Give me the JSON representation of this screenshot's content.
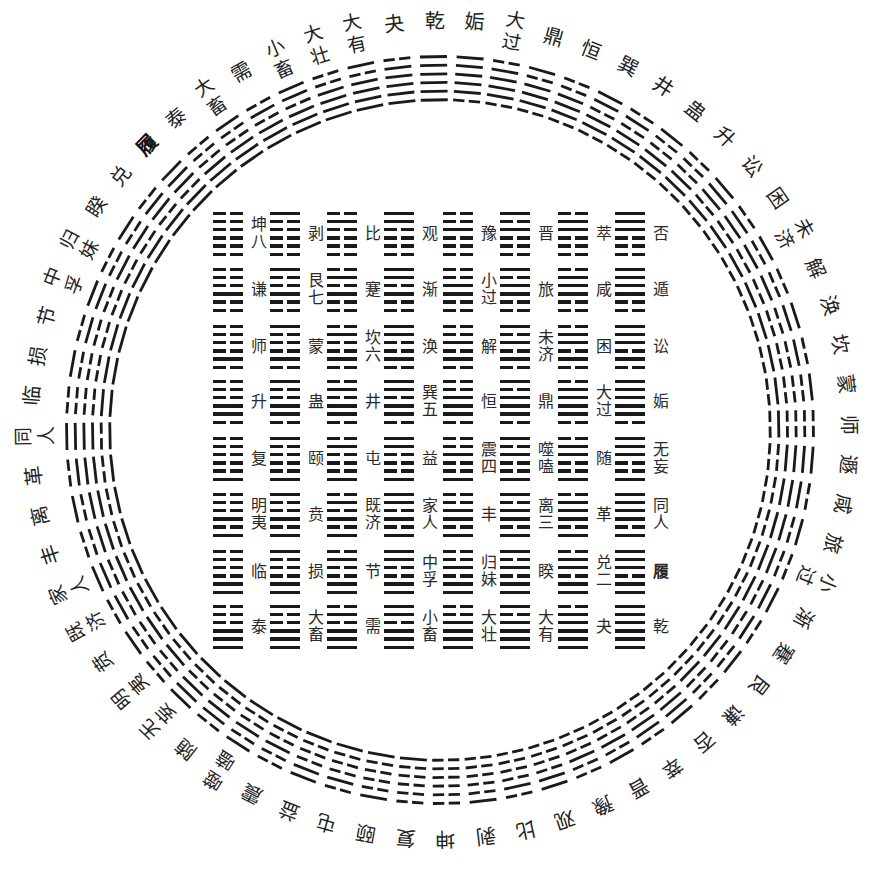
{
  "colors": {
    "background": "#ffffff",
    "ink": "#1a1a1a",
    "text": "#222222"
  },
  "ring": {
    "direction": "clockwise from top",
    "items": [
      {
        "label": "乾",
        "lines": "111111"
      },
      {
        "label": "姤",
        "lines": "111110"
      },
      {
        "label": "大过",
        "lines": "011110"
      },
      {
        "label": "鼎",
        "lines": "101110"
      },
      {
        "label": "恒",
        "lines": "001110"
      },
      {
        "label": "巽",
        "lines": "110110"
      },
      {
        "label": "井",
        "lines": "010110"
      },
      {
        "label": "蛊",
        "lines": "100110"
      },
      {
        "label": "升",
        "lines": "000110"
      },
      {
        "label": "讼",
        "lines": "111010"
      },
      {
        "label": "困",
        "lines": "011010"
      },
      {
        "label": "未济",
        "lines": "101010"
      },
      {
        "label": "解",
        "lines": "001010"
      },
      {
        "label": "涣",
        "lines": "110010"
      },
      {
        "label": "坎",
        "lines": "010010"
      },
      {
        "label": "蒙",
        "lines": "100010"
      },
      {
        "label": "师",
        "lines": "000010"
      },
      {
        "label": "遯",
        "lines": "111100"
      },
      {
        "label": "咸",
        "lines": "011100"
      },
      {
        "label": "旅",
        "lines": "101100"
      },
      {
        "label": "小过",
        "lines": "001100"
      },
      {
        "label": "渐",
        "lines": "110100"
      },
      {
        "label": "蹇",
        "lines": "010100"
      },
      {
        "label": "艮",
        "lines": "100100"
      },
      {
        "label": "谦",
        "lines": "000100"
      },
      {
        "label": "否",
        "lines": "111000"
      },
      {
        "label": "萃",
        "lines": "011000"
      },
      {
        "label": "晋",
        "lines": "101000"
      },
      {
        "label": "豫",
        "lines": "001000"
      },
      {
        "label": "观",
        "lines": "110000"
      },
      {
        "label": "比",
        "lines": "010000"
      },
      {
        "label": "剥",
        "lines": "100000"
      },
      {
        "label": "坤",
        "lines": "000000"
      },
      {
        "label": "复",
        "lines": "000001"
      },
      {
        "label": "颐",
        "lines": "100001"
      },
      {
        "label": "屯",
        "lines": "010001"
      },
      {
        "label": "益",
        "lines": "110001"
      },
      {
        "label": "震",
        "lines": "001001"
      },
      {
        "label": "噬嗑",
        "lines": "101001"
      },
      {
        "label": "随",
        "lines": "011001"
      },
      {
        "label": "无妄",
        "lines": "111001"
      },
      {
        "label": "明夷",
        "lines": "000101"
      },
      {
        "label": "贲",
        "lines": "100101"
      },
      {
        "label": "既济",
        "lines": "010101"
      },
      {
        "label": "家人",
        "lines": "110101"
      },
      {
        "label": "丰",
        "lines": "001101"
      },
      {
        "label": "离",
        "lines": "101101"
      },
      {
        "label": "革",
        "lines": "011101"
      },
      {
        "label": "同人",
        "lines": "111101"
      },
      {
        "label": "临",
        "lines": "000011"
      },
      {
        "label": "损",
        "lines": "100011"
      },
      {
        "label": "节",
        "lines": "010011"
      },
      {
        "label": "中孚",
        "lines": "110011"
      },
      {
        "label": "归妹",
        "lines": "001011"
      },
      {
        "label": "睽",
        "lines": "101011"
      },
      {
        "label": "兑",
        "lines": "011011"
      },
      {
        "label": "履",
        "lines": "111011",
        "bold": true
      },
      {
        "label": "泰",
        "lines": "000111"
      },
      {
        "label": "大畜",
        "lines": "100111"
      },
      {
        "label": "需",
        "lines": "010111"
      },
      {
        "label": "小畜",
        "lines": "110111"
      },
      {
        "label": "大壮",
        "lines": "001111"
      },
      {
        "label": "大有",
        "lines": "101111"
      },
      {
        "label": "夬",
        "lines": "011111"
      }
    ]
  },
  "grid": {
    "rows": [
      {
        "cells": [
          {
            "label": "坤八",
            "lines": "000000"
          },
          {
            "label": "剥",
            "lines": "100000"
          },
          {
            "label": "比",
            "lines": "010000"
          },
          {
            "label": "观",
            "lines": "110000"
          },
          {
            "label": "豫",
            "lines": "001000"
          },
          {
            "label": "晋",
            "lines": "101000"
          },
          {
            "label": "萃",
            "lines": "011000"
          },
          {
            "label": "否",
            "lines": "111000"
          }
        ]
      },
      {
        "cells": [
          {
            "label": "谦",
            "lines": "000100"
          },
          {
            "label": "艮七",
            "lines": "100100"
          },
          {
            "label": "蹇",
            "lines": "010100"
          },
          {
            "label": "渐",
            "lines": "110100"
          },
          {
            "label": "小过",
            "lines": "001100"
          },
          {
            "label": "旅",
            "lines": "101100"
          },
          {
            "label": "咸",
            "lines": "011100"
          },
          {
            "label": "遁",
            "lines": "111100"
          }
        ]
      },
      {
        "cells": [
          {
            "label": "师",
            "lines": "000010"
          },
          {
            "label": "蒙",
            "lines": "100010"
          },
          {
            "label": "坎六",
            "lines": "010010"
          },
          {
            "label": "涣",
            "lines": "110010"
          },
          {
            "label": "解",
            "lines": "001010"
          },
          {
            "label": "未济",
            "lines": "101010"
          },
          {
            "label": "困",
            "lines": "011010"
          },
          {
            "label": "讼",
            "lines": "111010"
          }
        ]
      },
      {
        "cells": [
          {
            "label": "升",
            "lines": "000110"
          },
          {
            "label": "蛊",
            "lines": "100110"
          },
          {
            "label": "井",
            "lines": "010110"
          },
          {
            "label": "巽五",
            "lines": "110110"
          },
          {
            "label": "恒",
            "lines": "001110"
          },
          {
            "label": "鼎",
            "lines": "101110"
          },
          {
            "label": "大过",
            "lines": "011110"
          },
          {
            "label": "姤",
            "lines": "111110"
          }
        ]
      },
      {
        "cells": [
          {
            "label": "复",
            "lines": "000001"
          },
          {
            "label": "颐",
            "lines": "100001"
          },
          {
            "label": "屯",
            "lines": "010001"
          },
          {
            "label": "益",
            "lines": "110001"
          },
          {
            "label": "震四",
            "lines": "001001"
          },
          {
            "label": "噬嗑",
            "lines": "101001"
          },
          {
            "label": "随",
            "lines": "011001"
          },
          {
            "label": "无妄",
            "lines": "111001"
          }
        ]
      },
      {
        "cells": [
          {
            "label": "明夷",
            "lines": "000101"
          },
          {
            "label": "贲",
            "lines": "100101"
          },
          {
            "label": "既济",
            "lines": "010101"
          },
          {
            "label": "家人",
            "lines": "110101"
          },
          {
            "label": "丰",
            "lines": "001101"
          },
          {
            "label": "离三",
            "lines": "101101"
          },
          {
            "label": "革",
            "lines": "011101"
          },
          {
            "label": "同人",
            "lines": "111101"
          }
        ]
      },
      {
        "cells": [
          {
            "label": "临",
            "lines": "000011"
          },
          {
            "label": "损",
            "lines": "100011"
          },
          {
            "label": "节",
            "lines": "010011"
          },
          {
            "label": "中孚",
            "lines": "110011"
          },
          {
            "label": "归妹",
            "lines": "001011"
          },
          {
            "label": "睽",
            "lines": "101011"
          },
          {
            "label": "兑二",
            "lines": "011011"
          },
          {
            "label": "履",
            "lines": "111011",
            "bold": true
          }
        ]
      },
      {
        "cells": [
          {
            "label": "泰",
            "lines": "000111"
          },
          {
            "label": "大畜",
            "lines": "100111"
          },
          {
            "label": "需",
            "lines": "010111"
          },
          {
            "label": "小畜",
            "lines": "110111"
          },
          {
            "label": "大壮",
            "lines": "001111"
          },
          {
            "label": "大有",
            "lines": "101111"
          },
          {
            "label": "夬",
            "lines": "011111"
          },
          {
            "label": "乾",
            "lines": "111111"
          }
        ]
      }
    ]
  }
}
